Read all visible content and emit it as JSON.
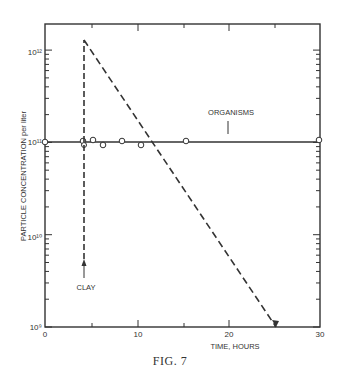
{
  "figure": {
    "caption": "FIG. 7"
  },
  "chart_data": {
    "type": "line",
    "title": "",
    "xlabel": "TIME, HOURS",
    "ylabel": "PARTICLE CONCENTRATION per liter",
    "xlim": [
      0,
      30
    ],
    "ylim": [
      1000000000.0,
      2000000000000.0
    ],
    "yscale": "log",
    "x_ticks": [
      0,
      10,
      20,
      30
    ],
    "x_tick_labels": [
      "0",
      "10",
      "20",
      "30"
    ],
    "y_ticks": [
      1000000000.0,
      10000000000.0,
      100000000000.0,
      1000000000000.0
    ],
    "y_tick_labels": [
      "10⁹",
      "10¹⁰",
      "10¹¹",
      "10¹²"
    ],
    "grid": false,
    "legend": null,
    "series": [
      {
        "name": "ORGANISMS",
        "style": "solid line with open circle markers",
        "points": [
          {
            "x": 0,
            "y": 100000000000.0
          },
          {
            "x": 4,
            "y": 100000000000.0
          },
          {
            "x": 4,
            "y": 95000000000.0
          },
          {
            "x": 5,
            "y": 102000000000.0
          },
          {
            "x": 6,
            "y": 93000000000.0
          },
          {
            "x": 8.2,
            "y": 102000000000.0
          },
          {
            "x": 10.2,
            "y": 93000000000.0
          },
          {
            "x": 15.2,
            "y": 102000000000.0
          },
          {
            "x": 30,
            "y": 100000000000.0
          }
        ]
      },
      {
        "name": "CLAY",
        "style": "dashed line",
        "points": [
          {
            "x": 4,
            "y": 1000000000.0
          },
          {
            "x": 4,
            "y": 1350000000000.0
          },
          {
            "x": 25,
            "y": 1000000000.0
          }
        ]
      }
    ],
    "annotations": [
      {
        "text": "ORGANISMS",
        "x": 16.5,
        "y": 160000000000.0,
        "pointer": "vertical tick to organisms line"
      },
      {
        "text": "CLAY",
        "x": 4,
        "y": 4500000000.0,
        "pointer": "up arrow at t=4 h"
      }
    ]
  }
}
